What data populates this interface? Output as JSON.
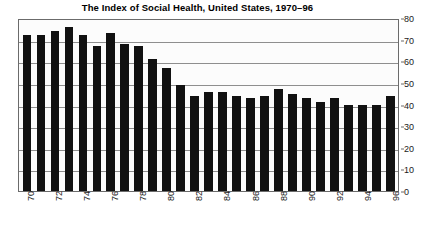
{
  "chart_data": {
    "type": "bar",
    "title": "The Index of Social Health, United States, 1970–96",
    "xlabel": "",
    "ylabel": "",
    "ylim": [
      0,
      80
    ],
    "ytick_step": 10,
    "yticks": [
      0,
      10,
      20,
      30,
      40,
      50,
      60,
      70,
      80
    ],
    "grid": true,
    "legend": "none",
    "bar_color": "#111111",
    "axis_color": "#6b6b6b",
    "x_tick_label_interval": 2,
    "x_tick_labels_shown": [
      "70",
      "72",
      "74",
      "76",
      "78",
      "80",
      "82",
      "84",
      "86",
      "88",
      "90",
      "92",
      "94",
      "96"
    ],
    "categories": [
      "70",
      "71",
      "72",
      "73",
      "74",
      "75",
      "76",
      "77",
      "78",
      "79",
      "80",
      "81",
      "82",
      "83",
      "84",
      "85",
      "86",
      "87",
      "88",
      "89",
      "90",
      "91",
      "92",
      "93",
      "94",
      "95",
      "96"
    ],
    "values": [
      72,
      72,
      74,
      76,
      72,
      67,
      73,
      68,
      67,
      61,
      57,
      49,
      44,
      46,
      46,
      44,
      43,
      44,
      47,
      45,
      43,
      41,
      43,
      40,
      40,
      40,
      44
    ]
  }
}
